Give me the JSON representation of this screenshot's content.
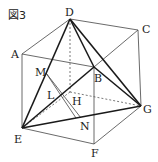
{
  "figure": {
    "title": "図3",
    "colors": {
      "line": "#333333",
      "bold": "#1a1a1a",
      "background": "#ffffff"
    },
    "vertices": {
      "A": {
        "x": 22,
        "y": 54
      },
      "B": {
        "x": 94,
        "y": 67
      },
      "C": {
        "x": 138,
        "y": 30
      },
      "D": {
        "x": 70,
        "y": 19
      },
      "E": {
        "x": 22,
        "y": 128
      },
      "F": {
        "x": 94,
        "y": 144
      },
      "G": {
        "x": 141,
        "y": 106
      },
      "P": {
        "x": 70,
        "y": 92
      },
      "M": {
        "x": 46,
        "y": 73
      },
      "L": {
        "x": 56,
        "y": 98
      },
      "H": {
        "x": 70,
        "y": 95
      },
      "N": {
        "x": 81,
        "y": 118
      }
    },
    "labels": [
      {
        "text": "D",
        "x": 65,
        "y": 16
      },
      {
        "text": "C",
        "x": 142,
        "y": 33
      },
      {
        "text": "A",
        "x": 11,
        "y": 58
      },
      {
        "text": "M",
        "x": 35,
        "y": 75
      },
      {
        "text": "B",
        "x": 94,
        "y": 82
      },
      {
        "text": "L",
        "x": 47,
        "y": 98
      },
      {
        "text": "H",
        "x": 72,
        "y": 105
      },
      {
        "text": "G",
        "x": 143,
        "y": 113
      },
      {
        "text": "N",
        "x": 80,
        "y": 130
      },
      {
        "text": "E",
        "x": 14,
        "y": 142
      },
      {
        "text": "F",
        "x": 91,
        "y": 156
      }
    ]
  }
}
